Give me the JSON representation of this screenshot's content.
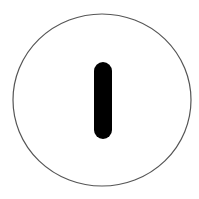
{
  "icon": {
    "name": "power-on-symbol",
    "label": "I",
    "colors": {
      "background": "#ffffff",
      "ring": "#555555",
      "bar": "#000000"
    }
  }
}
